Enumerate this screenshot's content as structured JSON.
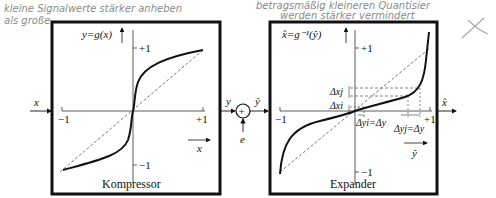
{
  "annotations": {
    "handwritten_left_line1": "kleine Signalwerte stärker anheben",
    "handwritten_left_line2": "als große",
    "handwritten_right_line1": "betragsmäßig kleineren Quantisier",
    "handwritten_right_line2": "werden stärker vermindert"
  },
  "compressor": {
    "title": "Kompressor",
    "y_axis_label": "y=g(x)",
    "x_axis_label": "x",
    "tick_plus1_y": "+1",
    "tick_minus1_y": "−1",
    "tick_plus1_x": "+1",
    "tick_minus1_x": "−1"
  },
  "expander": {
    "title": "Expander",
    "y_axis_label": "x̂=g⁻¹(ŷ)",
    "x_axis_label": "ŷ",
    "tick_plus1_y": "+1",
    "tick_minus1_y": "−1",
    "tick_plus1_x": "+1",
    "tick_minus1_x": "−1",
    "delta_xj": "Δxj",
    "delta_xi": "Δxi",
    "delta_yi": "Δyi=Δy",
    "delta_yj": "Δyj=Δy"
  },
  "signal_flow": {
    "input": "x",
    "compressor_output": "y",
    "adder_symbol": "+",
    "noise": "e",
    "expander_input": "ŷ",
    "output": "x̂"
  }
}
